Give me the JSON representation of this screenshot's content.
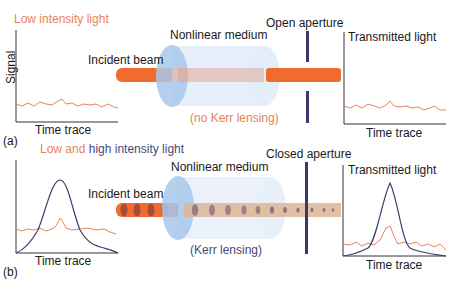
{
  "panel_a": {
    "label": "(a)",
    "title": "Low intensity light",
    "signal_label": "Signal",
    "incident_label": "Incident beam",
    "medium_label": "Nonlinear medium",
    "aperture_label": "Open aperture",
    "transmitted_label": "Transmitted light",
    "time_trace_left": "Time trace",
    "time_trace_right": "Time trace",
    "lensing_note": "(no Kerr lensing)"
  },
  "panel_b": {
    "label": "(b)",
    "title_low": "Low and",
    "title_high": "high intensity light",
    "incident_label": "Incident beam",
    "medium_label": "Nonlinear medium",
    "aperture_label": "Closed aperture",
    "transmitted_label": "Transmitted light",
    "time_trace_left": "Time trace",
    "time_trace_right": "Time trace",
    "lensing_note": "(Kerr lensing)"
  },
  "colors": {
    "low_intensity": "#e8825a",
    "high_intensity": "#3e3e6e",
    "beam": "#f26b2e",
    "medium": "#a8c8ec",
    "aperture": "#3a3a6a"
  }
}
